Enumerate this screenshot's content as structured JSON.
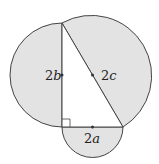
{
  "labels": {
    "side_b": {
      "num": "2",
      "var": "b"
    },
    "hypotenuse": {
      "num": "2",
      "var": "c"
    },
    "side_a": {
      "num": "2",
      "var": "a"
    }
  },
  "colors": {
    "fill": "#e3e3e3",
    "stroke": "#444444"
  }
}
